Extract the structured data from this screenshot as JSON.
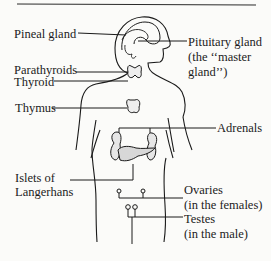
{
  "diagram": {
    "type": "anatomical illustration",
    "labels": {
      "pineal": "Pineal gland",
      "pituitary_line1": "Pituitary gland",
      "pituitary_line2": "(the ‘‘master",
      "pituitary_line3": "gland’’)",
      "parathyroids": "Parathyroids",
      "thyroid": "Thyroid",
      "thymus": "Thymus",
      "adrenals": "Adrenals",
      "islets_line1": "Islets of",
      "islets_line2": "Langerhans",
      "ovaries_line1": "Ovaries",
      "ovaries_line2": "(in the females)",
      "testes_line1": "Testes",
      "testes_line2": "(in the male)"
    },
    "colors": {
      "ink": "#1a1a1a",
      "background": "#fbfbf9"
    }
  }
}
